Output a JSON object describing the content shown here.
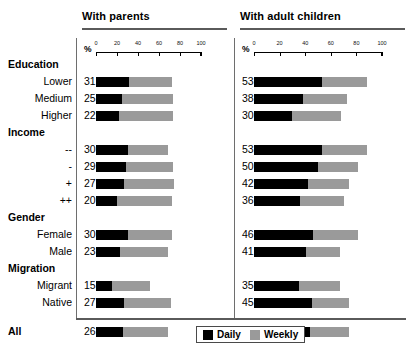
{
  "chart_data": {
    "type": "bar",
    "orientation": "horizontal",
    "stacked": true,
    "title": "",
    "xlabel": "%",
    "ylabel": "",
    "xlim": [
      0,
      100
    ],
    "xticks": [
      0,
      20,
      40,
      60,
      80,
      100
    ],
    "grid": false,
    "legend_position": "bottom-right",
    "legend": [
      "Daily",
      "Weekly"
    ],
    "colors": {
      "daily": "#000000",
      "weekly": "#9a9a9a"
    },
    "panels": [
      {
        "name": "With parents",
        "axis_unit": "%",
        "series": [
          {
            "name": "Daily",
            "values": [
              31,
              25,
              22,
              30,
              29,
              27,
              20,
              30,
              23,
              15,
              27,
              26
            ]
          },
          {
            "name": "Weekly",
            "values": [
              41,
              48,
              51,
              39,
              44,
              47,
              52,
              42,
              46,
              36,
              44,
              43
            ]
          }
        ],
        "totals": [
          72,
          73,
          73,
          69,
          73,
          74,
          72,
          72,
          69,
          51,
          71,
          69
        ]
      },
      {
        "name": "With adult children",
        "axis_unit": "%",
        "series": [
          {
            "name": "Daily",
            "values": [
              53,
              38,
              30,
              53,
              50,
              42,
              36,
              46,
              41,
              35,
              45,
              44
            ]
          },
          {
            "name": "Weekly",
            "values": [
              35,
              35,
              38,
              35,
              31,
              32,
              34,
              35,
              26,
              32,
              29,
              30
            ]
          }
        ],
        "totals": [
          88,
          73,
          68,
          88,
          81,
          74,
          70,
          81,
          67,
          67,
          74,
          74
        ]
      }
    ],
    "rows": [
      {
        "label": "Education",
        "type": "group"
      },
      {
        "label": "Lower",
        "type": "item",
        "index": 0
      },
      {
        "label": "Medium",
        "type": "item",
        "index": 1
      },
      {
        "label": "Higher",
        "type": "item",
        "index": 2
      },
      {
        "label": "Income",
        "type": "group"
      },
      {
        "label": "--",
        "type": "item",
        "index": 3
      },
      {
        "label": "-",
        "type": "item",
        "index": 4
      },
      {
        "label": "+",
        "type": "item",
        "index": 5
      },
      {
        "label": "++",
        "type": "item",
        "index": 6
      },
      {
        "label": "Gender",
        "type": "group"
      },
      {
        "label": "Female",
        "type": "item",
        "index": 7
      },
      {
        "label": "Male",
        "type": "item",
        "index": 8
      },
      {
        "label": "Migration",
        "type": "group"
      },
      {
        "label": "Migrant",
        "type": "item",
        "index": 9
      },
      {
        "label": "Native",
        "type": "item",
        "index": 10
      },
      {
        "label": "All",
        "type": "total",
        "index": 11
      }
    ]
  },
  "titles": {
    "left": "With parents",
    "right": "With adult children"
  },
  "axis": {
    "unit_symbol": "%",
    "ticks": [
      "0",
      "20",
      "40",
      "60",
      "80",
      "100"
    ]
  },
  "legend": {
    "daily": "Daily",
    "weekly": "Weekly"
  }
}
